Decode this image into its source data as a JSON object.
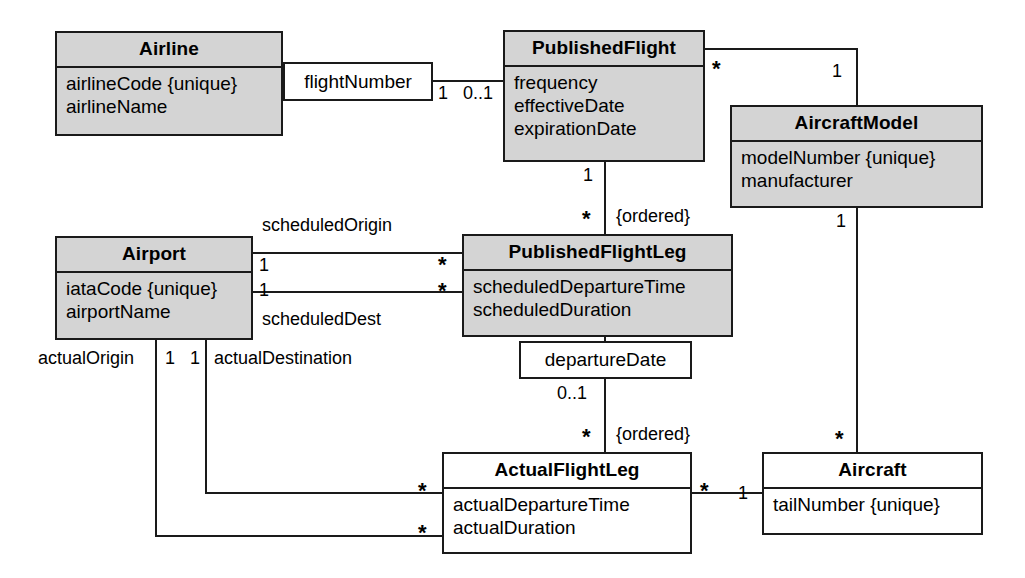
{
  "diagram": {
    "type": "uml-class-diagram",
    "colors": {
      "class_fill": "#d4d4d4",
      "plain_fill": "#ffffff",
      "stroke": "#1a1a1a",
      "text": "#000000"
    }
  },
  "classes": {
    "airline": {
      "name": "Airline",
      "attributes": [
        "airlineCode {unique}",
        "airlineName"
      ],
      "fill": "#d4d4d4"
    },
    "published_flight": {
      "name": "PublishedFlight",
      "attributes": [
        "frequency",
        "effectiveDate",
        "expirationDate"
      ],
      "fill": "#d4d4d4"
    },
    "aircraft_model": {
      "name": "AircraftModel",
      "attributes": [
        "modelNumber {unique}",
        "manufacturer"
      ],
      "fill": "#d4d4d4"
    },
    "airport": {
      "name": "Airport",
      "attributes": [
        "iataCode {unique}",
        "airportName"
      ],
      "fill": "#d4d4d4"
    },
    "published_flight_leg": {
      "name": "PublishedFlightLeg",
      "attributes": [
        "scheduledDepartureTime",
        "scheduledDuration"
      ],
      "fill": "#d4d4d4"
    },
    "actual_flight_leg": {
      "name": "ActualFlightLeg",
      "attributes": [
        "actualDepartureTime",
        "actualDuration"
      ],
      "fill": "#ffffff"
    },
    "aircraft": {
      "name": "Aircraft",
      "attributes": [
        "tailNumber {unique}"
      ],
      "fill": "#ffffff"
    }
  },
  "association_classes": {
    "flight_number": {
      "label": "flightNumber"
    },
    "departure_date": {
      "label": "departureDate"
    }
  },
  "labels": {
    "airline_to_flightnumber_mult": "1",
    "flightnumber_to_publishedflight_mult": "0..1",
    "publishedflight_to_aircraftmodel_star": "*",
    "aircraftmodel_to_publishedflight_one": "1",
    "publishedflight_leg_one": "1",
    "publishedflight_leg_star": "*",
    "publishedflight_leg_ordered": "{ordered}",
    "scheduled_origin": "scheduledOrigin",
    "scheduled_origin_airport_mult": "1",
    "scheduled_origin_leg_mult": "*",
    "scheduled_dest_airport_mult": "1",
    "scheduled_dest_leg_mult": "*",
    "scheduled_dest": "scheduledDest",
    "actual_origin": "actualOrigin",
    "actual_origin_mult": "1",
    "actual_destination_mult": "1",
    "actual_destination": "actualDestination",
    "departuredate_to_leg_mult": "0..1",
    "actualleg_star": "*",
    "actualleg_ordered": "{ordered}",
    "actual_origin_leg_star": "*",
    "actual_destination_leg_star": "*",
    "actualleg_to_aircraft_star": "*",
    "aircraft_to_actualleg_one": "1",
    "aircraftmodel_to_aircraft_one": "1",
    "aircraft_to_aircraftmodel_star": "*"
  }
}
